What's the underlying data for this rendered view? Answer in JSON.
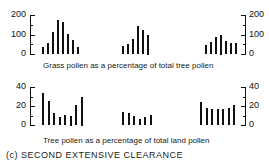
{
  "title": "(c) SECOND EXTENSIVE CLEARANCE",
  "chart_data": [
    {
      "type": "bar",
      "title": "Grass pollen as a percentage of total tree pollen",
      "ylim": [
        0,
        200
      ],
      "yticks": [
        "0",
        "100",
        "200"
      ],
      "ytick_values": [
        0,
        100,
        200
      ],
      "axes": "left and right",
      "grid": false,
      "groups": [
        {
          "name": "left",
          "values": [
            35,
            55,
            115,
            175,
            165,
            105,
            70,
            35
          ]
        },
        {
          "name": "middle",
          "values": [
            40,
            50,
            75,
            145,
            125,
            100
          ]
        },
        {
          "name": "right",
          "values": [
            45,
            60,
            85,
            100,
            65,
            55,
            55
          ]
        }
      ]
    },
    {
      "type": "bar",
      "title": "Tree pollen as a percentage of total land pollen",
      "ylim": [
        0,
        40
      ],
      "yticks": [
        "0",
        "20",
        "40"
      ],
      "ytick_values": [
        0,
        20,
        40
      ],
      "axes": "left and right",
      "grid": false,
      "groups": [
        {
          "name": "left",
          "values": [
            34,
            25,
            13,
            8,
            11,
            10,
            21,
            30
          ]
        },
        {
          "name": "middle",
          "values": [
            14,
            13,
            9,
            6,
            8,
            11
          ]
        },
        {
          "name": "right",
          "values": [
            24,
            18,
            17,
            17,
            17,
            18,
            21
          ]
        }
      ]
    }
  ]
}
